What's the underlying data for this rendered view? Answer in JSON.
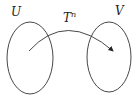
{
  "labels": {
    "set_u": "U",
    "set_v": "V",
    "map": "T",
    "map_exp": "n"
  },
  "colors": {
    "stroke": "#333333",
    "text": "#222222"
  }
}
